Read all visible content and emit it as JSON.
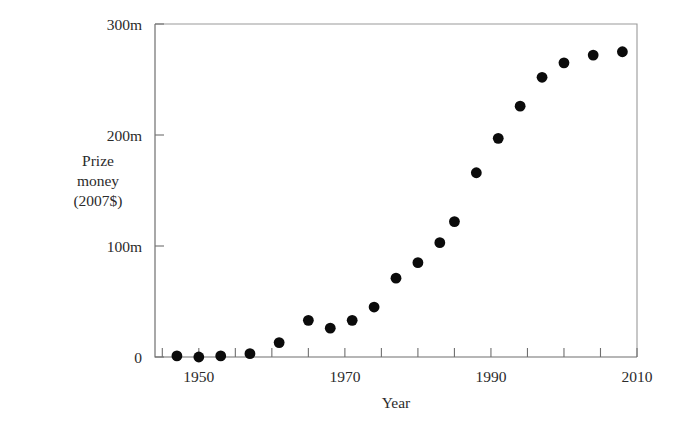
{
  "figure": {
    "background_color": "#ffffff",
    "point_color": "#0b0b0b",
    "axis_color": "#6f6f6f",
    "frame_color": "#9a9a9a"
  },
  "axes": {
    "y_title_line1": "Prize",
    "y_title_line2": "money",
    "y_title_line3": "(2007$)",
    "x_title": "Year",
    "y_ticks": [
      "0",
      "100m",
      "200m",
      "300m"
    ],
    "x_ticks": [
      "1950",
      "1970",
      "1990",
      "2010"
    ]
  },
  "chart_data": {
    "type": "scatter",
    "title": "",
    "xlabel": "Year",
    "ylabel": "Prize money (2007$)",
    "xlim": [
      1944,
      2010
    ],
    "ylim": [
      0,
      300
    ],
    "y_unit": "millions of 2007 dollars",
    "grid": false,
    "legend": "none",
    "x_tick_values": [
      1950,
      1970,
      1990,
      2010
    ],
    "x_tick_labels": [
      "1950",
      "1970",
      "1990",
      "2010"
    ],
    "y_tick_values": [
      0,
      100,
      200,
      300
    ],
    "y_tick_labels": [
      "0",
      "100m",
      "200m",
      "300m"
    ],
    "series": [
      {
        "name": "Prize money",
        "marker": "filled-circle",
        "points": [
          {
            "x": 1947,
            "y": 1
          },
          {
            "x": 1950,
            "y": 0
          },
          {
            "x": 1953,
            "y": 1
          },
          {
            "x": 1957,
            "y": 3
          },
          {
            "x": 1961,
            "y": 13
          },
          {
            "x": 1965,
            "y": 33
          },
          {
            "x": 1968,
            "y": 26
          },
          {
            "x": 1971,
            "y": 33
          },
          {
            "x": 1974,
            "y": 45
          },
          {
            "x": 1977,
            "y": 71
          },
          {
            "x": 1980,
            "y": 85
          },
          {
            "x": 1983,
            "y": 103
          },
          {
            "x": 1985,
            "y": 122
          },
          {
            "x": 1988,
            "y": 166
          },
          {
            "x": 1991,
            "y": 197
          },
          {
            "x": 1994,
            "y": 226
          },
          {
            "x": 1997,
            "y": 252
          },
          {
            "x": 2000,
            "y": 265
          },
          {
            "x": 2004,
            "y": 272
          },
          {
            "x": 2008,
            "y": 275
          }
        ]
      }
    ]
  },
  "geometry": {
    "plot_left": 155,
    "plot_right": 637,
    "plot_top": 24,
    "plot_bottom": 357,
    "x_pixel_1950": 199,
    "x_pixel_2010": 637,
    "y_pixel_0": 357,
    "y_pixel_300": 24,
    "point_radius": 5.4
  }
}
